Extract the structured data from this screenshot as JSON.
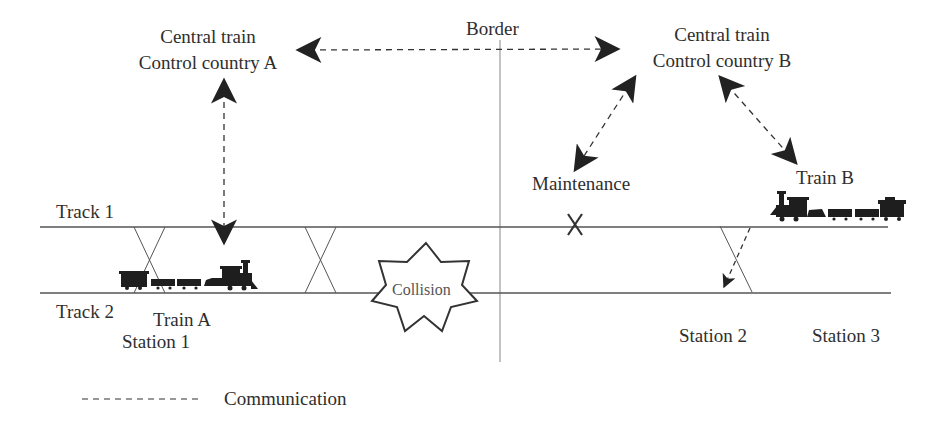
{
  "diagram": {
    "type": "railway-communication-scenario",
    "labels": {
      "control_a_line1": "Central train",
      "control_a_line2": "Control country A",
      "control_b_line1": "Central train",
      "control_b_line2": "Control country B",
      "border": "Border",
      "maintenance": "Maintenance",
      "train_b": "Train B",
      "train_a": "Train A",
      "track_1": "Track 1",
      "track_2": "Track 2",
      "station_1": "Station 1",
      "station_2": "Station 2",
      "station_3": "Station 3",
      "collision": "Collision",
      "maintenance_marker": "X"
    },
    "legend": {
      "line_style": "dashed",
      "label": "Communication"
    },
    "connections": [
      {
        "from": "Central train Control country A",
        "to": "Central train Control country B",
        "style": "dashed",
        "arrows": "both"
      },
      {
        "from": "Central train Control country A",
        "to": "Train A",
        "style": "dashed",
        "arrows": "both"
      },
      {
        "from": "Central train Control country B",
        "to": "Maintenance",
        "style": "dashed",
        "arrows": "both"
      },
      {
        "from": "Central train Control country B",
        "to": "Train B",
        "style": "dashed",
        "arrows": "both"
      },
      {
        "from": "Train B (Track 1)",
        "to": "Track 2 at Station 2",
        "style": "dashed",
        "arrows": "end"
      }
    ],
    "colors": {
      "line": "#555555",
      "arrow": "#222222",
      "text": "#2e2e2e",
      "background": "#ffffff"
    }
  }
}
